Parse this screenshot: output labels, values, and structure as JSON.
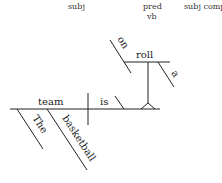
{
  "diagram": {
    "type": "Reed-Kellogg sentence diagram",
    "labels": {
      "subject": "subj",
      "predicate_line1": "pred",
      "predicate_line2": "vb",
      "subject_complement": "subj comp"
    },
    "words": {
      "subject": "team",
      "verb": "is",
      "complement": "roll",
      "subject_modifier_1": "The",
      "subject_modifier_2": "basketball",
      "complement_modifier_1": "on",
      "complement_modifier_2": "a"
    },
    "colors": {
      "line": "#222222",
      "text": "#222222",
      "background": "#ffffff"
    }
  }
}
